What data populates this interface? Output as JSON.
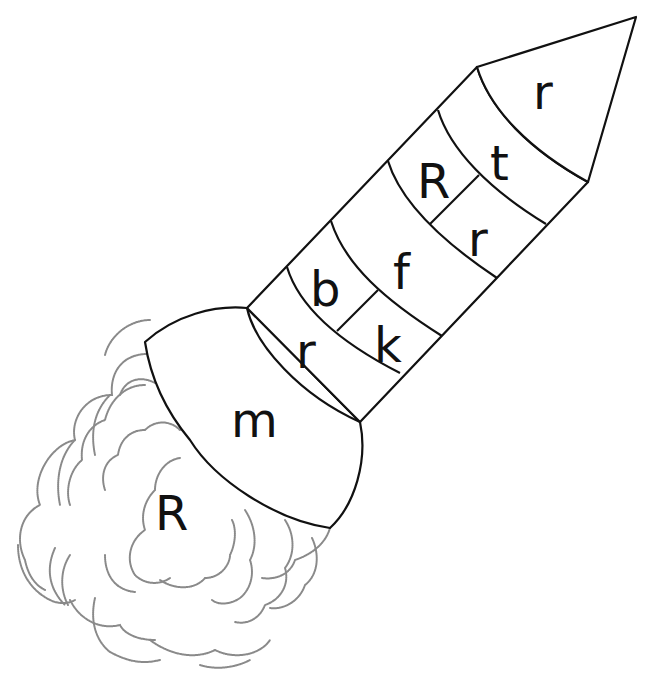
{
  "worksheet": {
    "subject": "rocket",
    "colors": {
      "outline": "#111111",
      "cloud": "#8a8a8a",
      "background": "#ffffff"
    },
    "sections": {
      "nose_cone": "r",
      "band1_upper": "t",
      "band1_lower": "r",
      "band2_upper": "R",
      "band3": "f",
      "band4_upper": "b",
      "band4_lower": "k",
      "band5": "r",
      "base": "m",
      "smoke_cloud": "R"
    }
  }
}
